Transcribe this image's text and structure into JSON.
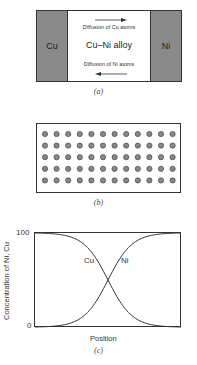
{
  "panel_a": {
    "left_metal": "Cu",
    "right_metal": "Ni",
    "alloy_label": "Cu–Ni alloy",
    "top_arrow_text": "Diffusion of Cu atoms",
    "top_arrow_direction": "right",
    "bottom_arrow_text": "Diffusion of Ni atoms",
    "bottom_arrow_direction": "left",
    "metal_color": "#8a8a8a",
    "caption": "(a)"
  },
  "panel_b": {
    "rows": 5,
    "columns": 12,
    "atom_color": "#888888",
    "caption": "(b)"
  },
  "panel_c": {
    "y_axis_label": "Concentration of Ni, Cu",
    "x_axis_label": "Position",
    "y_tick_top": "100",
    "y_tick_bottom": "0",
    "curve_label_cu": "Cu",
    "curve_label_ni": "Ni",
    "caption": "(c)"
  },
  "chart_data": {
    "type": "line",
    "title": "",
    "xlabel": "Position",
    "ylabel": "Concentration of Ni, Cu",
    "ylim": [
      0,
      100
    ],
    "yticks": [
      "0",
      "100"
    ],
    "grid": false,
    "x": [
      0,
      0.1,
      0.2,
      0.3,
      0.35,
      0.4,
      0.45,
      0.5,
      0.55,
      0.6,
      0.65,
      0.7,
      0.8,
      0.9,
      1.0
    ],
    "series": [
      {
        "name": "Cu",
        "values": [
          100,
          100,
          100,
          98,
          93,
          82,
          66,
          50,
          34,
          18,
          7,
          2,
          0,
          0,
          0
        ]
      },
      {
        "name": "Ni",
        "values": [
          0,
          0,
          0,
          2,
          7,
          18,
          34,
          50,
          66,
          82,
          93,
          98,
          100,
          100,
          100
        ]
      }
    ]
  }
}
